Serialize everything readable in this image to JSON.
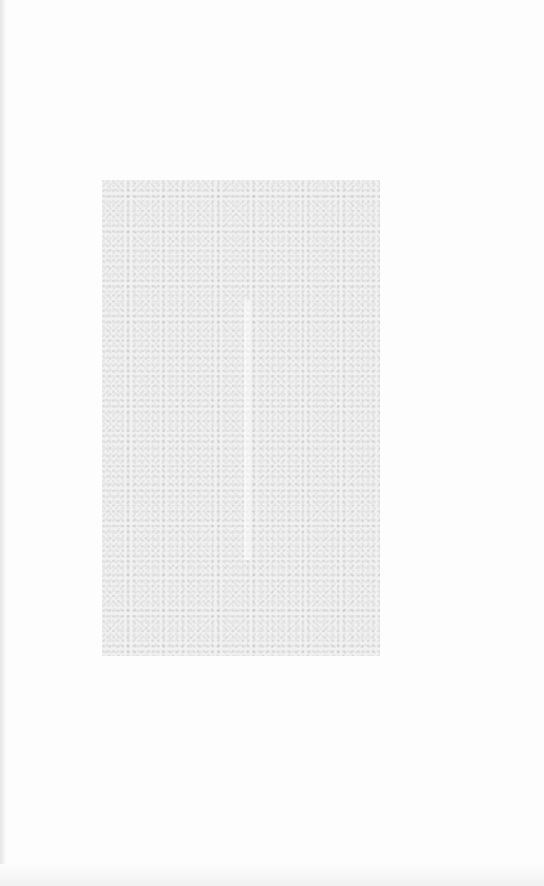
{
  "page": {
    "background_color": "#fdfdfd",
    "image_region": {
      "description": "faded, illegible gray image area",
      "color": "#f1f1f1"
    }
  }
}
